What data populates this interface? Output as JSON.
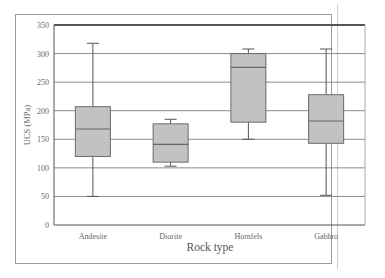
{
  "chart_data": {
    "type": "box",
    "title": "",
    "xlabel": "Rock type",
    "ylabel": "UCS (MPa)",
    "ylim": [
      0,
      350
    ],
    "yticks": [
      0,
      50,
      100,
      150,
      200,
      250,
      300,
      350
    ],
    "grid": true,
    "legend": null,
    "categories": [
      "Andesite",
      "Diorite",
      "Hornfels",
      "Gabbro"
    ],
    "series": [
      {
        "name": "Andesite",
        "min": 50,
        "q1": 120,
        "median": 168,
        "q3": 207,
        "max": 318
      },
      {
        "name": "Diorite",
        "min": 103,
        "q1": 110,
        "median": 141,
        "q3": 177,
        "max": 185
      },
      {
        "name": "Hornfels",
        "min": 150,
        "q1": 180,
        "median": 276,
        "q3": 300,
        "max": 308
      },
      {
        "name": "Gabbro",
        "min": 52,
        "q1": 143,
        "median": 182,
        "q3": 228,
        "max": 308
      }
    ],
    "colors": {
      "box_fill": "#c2c2c2",
      "box_stroke": "#6a6a6a",
      "grid": "#8c8c8c",
      "axis": "#555555"
    }
  }
}
